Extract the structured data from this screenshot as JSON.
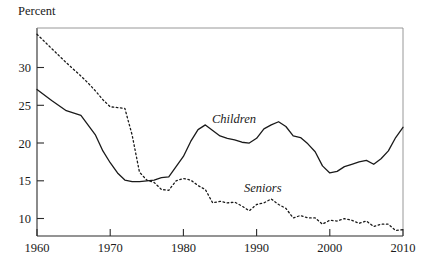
{
  "chart_data": {
    "type": "line",
    "title": "",
    "ylabel": "Percent",
    "xlabel": "",
    "grid": false,
    "legend_position": "inline-annotations",
    "xlim": [
      1960,
      2010
    ],
    "ylim": [
      8.2,
      34.6
    ],
    "xticks": [
      1960,
      1970,
      1980,
      1990,
      2000,
      2010
    ],
    "xtick_labels": [
      "1960",
      "1970",
      "1980",
      "1990",
      "2000",
      "2010"
    ],
    "yticks": [
      10,
      15,
      20,
      25,
      30
    ],
    "ytick_labels": [
      "10",
      "15",
      "20",
      "25",
      "30"
    ],
    "series": [
      {
        "name": "Children",
        "style": "solid",
        "label": "Children",
        "color": "#1a1a1a",
        "x": [
          1960,
          1962,
          1964,
          1966,
          1968,
          1969,
          1970,
          1971,
          1972,
          1973,
          1974,
          1975,
          1976,
          1977,
          1978,
          1979,
          1980,
          1981,
          1982,
          1983,
          1984,
          1985,
          1986,
          1987,
          1988,
          1989,
          1990,
          1991,
          1992,
          1993,
          1994,
          1995,
          1996,
          1997,
          1998,
          1999,
          2000,
          2001,
          2002,
          2003,
          2004,
          2005,
          2006,
          2007,
          2008,
          2009,
          2010
        ],
        "y": [
          26.8,
          25.4,
          24.1,
          23.5,
          21.0,
          19.0,
          17.5,
          16.2,
          15.3,
          15.1,
          15.1,
          15.2,
          15.3,
          15.6,
          15.7,
          17.0,
          18.3,
          20.2,
          21.7,
          22.3,
          21.6,
          20.9,
          20.6,
          20.4,
          20.1,
          20.0,
          20.6,
          21.8,
          22.3,
          22.7,
          22.1,
          20.9,
          20.7,
          19.9,
          18.9,
          17.1,
          16.2,
          16.4,
          17.0,
          17.3,
          17.6,
          17.8,
          17.3,
          18.0,
          19.0,
          20.7,
          22.0
        ]
      },
      {
        "name": "Seniors",
        "style": "dotted",
        "label": "Seniors",
        "color": "#1a1a1a",
        "x": [
          1960,
          1962,
          1964,
          1966,
          1967,
          1968,
          1969,
          1970,
          1971,
          1972,
          1973,
          1974,
          1975,
          1976,
          1977,
          1978,
          1979,
          1980,
          1981,
          1982,
          1983,
          1984,
          1985,
          1986,
          1987,
          1988,
          1989,
          1990,
          1991,
          1992,
          1993,
          1994,
          1995,
          1996,
          1997,
          1998,
          1999,
          2000,
          2001,
          2002,
          2003,
          2004,
          2005,
          2006,
          2007,
          2008,
          2009,
          2010
        ],
        "y": [
          33.8,
          32.0,
          30.2,
          28.5,
          27.6,
          26.6,
          25.5,
          24.6,
          24.5,
          24.4,
          21.0,
          16.3,
          15.3,
          15.0,
          14.1,
          14.0,
          15.2,
          15.5,
          15.3,
          14.6,
          14.1,
          12.4,
          12.6,
          12.4,
          12.5,
          12.0,
          11.4,
          12.2,
          12.4,
          12.9,
          12.2,
          11.7,
          10.5,
          10.8,
          10.5,
          10.5,
          9.7,
          10.2,
          10.1,
          10.4,
          10.2,
          9.8,
          10.1,
          9.4,
          9.7,
          9.7,
          8.9,
          9.0
        ]
      }
    ]
  },
  "annotations": [
    {
      "name": "children-label",
      "text": "Children"
    },
    {
      "name": "seniors-label",
      "text": "Seniors"
    }
  ]
}
